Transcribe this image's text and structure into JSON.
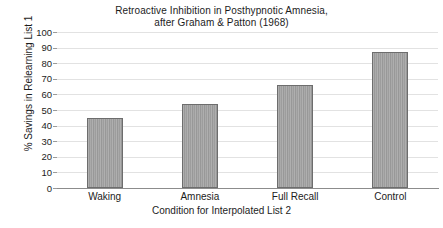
{
  "chart_data": {
    "type": "bar",
    "title": "Retroactive Inhibition in Posthypnotic Amnesia,",
    "subtitle": "after Graham & Patton (1968)",
    "title_lines": [
      "Retroactive Inhibition in Posthypnotic Amnesia,",
      "after Graham & Patton (1968)"
    ],
    "categories": [
      "Waking",
      "Amnesia",
      "Full Recall",
      "Control"
    ],
    "values": [
      45,
      54,
      66,
      87
    ],
    "xlabel": "Condition for Interpolated List 2",
    "ylabel": "% Savings in Relearning List 1",
    "ylim": [
      0,
      100
    ],
    "ytick_values": [
      0,
      10,
      20,
      30,
      40,
      50,
      60,
      70,
      80,
      90,
      100
    ],
    "ytick_labels": [
      "0",
      "10",
      "20",
      "30",
      "40",
      "50",
      "60",
      "70",
      "80",
      "90",
      "100"
    ],
    "ytick_step": 10,
    "grid": true,
    "grid_axis": "y",
    "legend": false,
    "legend_position": "none",
    "bar_fill_color": "#a0a0a0",
    "bar_edge_color": "#6d6d6d",
    "grid_color": "#e2e2e2",
    "axis_color": "#8c8c8c",
    "text_color": "#1c1c1c",
    "background_color": "#ffffff"
  }
}
